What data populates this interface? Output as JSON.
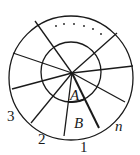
{
  "diagram": {
    "labels": {
      "A": "A",
      "B": "B",
      "n": "n",
      "one": "1",
      "two": "2",
      "three": "3",
      "ellipsis": "......"
    },
    "colors": {
      "stroke": "#1a1a1a",
      "background": "#ffffff"
    }
  }
}
